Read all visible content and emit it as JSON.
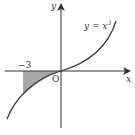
{
  "diagram": {
    "type": "function-graph",
    "function_label": "y = x",
    "function_exponent": "3",
    "x_axis_label": "x",
    "y_axis_label": "y",
    "origin_label": "O",
    "marked_x_value": "−3",
    "shaded_region": {
      "from_x": -3,
      "to_x": 0,
      "description": "area between curve y = x^3 and x-axis from x = -3 to 0"
    },
    "colors": {
      "curve": "#333333",
      "axes": "#333333",
      "shade": "#a8a8a8"
    }
  }
}
